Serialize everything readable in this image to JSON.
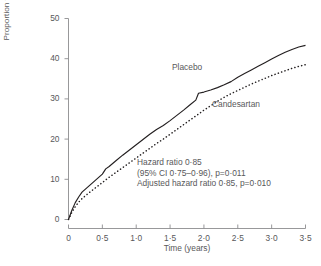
{
  "chart_data": {
    "type": "line",
    "title": "",
    "xlabel": "Time (years)",
    "ylabel": "Proportion with cardiovascular death or hospital admission for CHF (%)",
    "xlim": [
      0,
      3.5
    ],
    "ylim": [
      0,
      50
    ],
    "xticks": [
      0,
      0.5,
      1.0,
      1.5,
      2.0,
      2.5,
      3.0,
      3.5
    ],
    "xtick_labels": [
      "0",
      "0·5",
      "1·0",
      "1·5",
      "2·0",
      "2·5",
      "3·0",
      "3·5"
    ],
    "yticks": [
      0,
      10,
      20,
      30,
      40,
      50
    ],
    "ytick_labels": [
      "0",
      "10",
      "20",
      "30",
      "40",
      "50"
    ],
    "grid": false,
    "legend_position": "inline-labels",
    "series": [
      {
        "name": "Placebo",
        "style": "solid",
        "color": "#231f20",
        "x": [
          0,
          0.05,
          0.1,
          0.15,
          0.2,
          0.3,
          0.4,
          0.5,
          0.55,
          0.6,
          0.7,
          0.8,
          0.9,
          1.0,
          1.1,
          1.2,
          1.3,
          1.4,
          1.5,
          1.6,
          1.7,
          1.8,
          1.88,
          1.92,
          2.0,
          2.1,
          2.2,
          2.3,
          2.4,
          2.5,
          2.6,
          2.7,
          2.8,
          2.9,
          3.0,
          3.1,
          3.2,
          3.3,
          3.4,
          3.5
        ],
        "values": [
          0,
          2.3,
          4.2,
          5.6,
          6.8,
          8.3,
          9.8,
          11.3,
          12.6,
          13.2,
          14.6,
          16.0,
          17.3,
          18.6,
          19.9,
          21.2,
          22.4,
          23.4,
          24.6,
          25.9,
          27.2,
          28.6,
          29.7,
          31.4,
          31.7,
          32.2,
          32.8,
          33.5,
          34.3,
          35.4,
          36.3,
          37.2,
          38.1,
          39.0,
          39.9,
          40.8,
          41.6,
          42.3,
          42.9,
          43.3
        ]
      },
      {
        "name": "Candesartan",
        "style": "dashed",
        "color": "#231f20",
        "x": [
          0,
          0.05,
          0.1,
          0.15,
          0.2,
          0.3,
          0.4,
          0.5,
          0.6,
          0.7,
          0.8,
          0.9,
          1.0,
          1.1,
          1.2,
          1.3,
          1.4,
          1.5,
          1.6,
          1.7,
          1.8,
          1.9,
          2.0,
          2.1,
          2.2,
          2.3,
          2.4,
          2.5,
          2.6,
          2.7,
          2.8,
          2.9,
          3.0,
          3.1,
          3.2,
          3.3,
          3.4,
          3.5
        ],
        "values": [
          0,
          1.8,
          3.2,
          4.3,
          5.2,
          6.6,
          7.9,
          9.2,
          10.5,
          11.7,
          12.9,
          14.1,
          15.3,
          16.5,
          17.7,
          18.9,
          20.0,
          21.2,
          22.4,
          23.6,
          24.8,
          26.0,
          27.2,
          28.3,
          29.4,
          30.4,
          31.3,
          32.1,
          32.9,
          33.7,
          34.4,
          35.1,
          35.8,
          36.4,
          37.0,
          37.6,
          38.1,
          38.5
        ]
      }
    ],
    "annotations": [
      "Hazard ratio 0·85",
      "(95% CI 0·75–0·96), p=0·011",
      "Adjusted hazard ratio 0·85, p=0·010"
    ]
  },
  "axis_color": "#8c8c8e",
  "text_color": "#58585a"
}
